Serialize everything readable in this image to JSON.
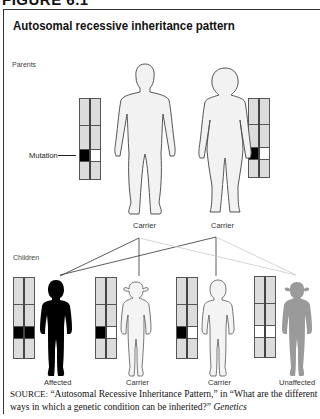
{
  "figure_heading": "FIGURE 6.1",
  "title": "Autosomal recessive inheritance pattern",
  "labels": {
    "parents": "Parents",
    "children": "Children",
    "mutation": "Mutation"
  },
  "parents": [
    {
      "label": "Carrier",
      "sex": "male",
      "chromosomes": [
        "mutated",
        "normal"
      ]
    },
    {
      "label": "Carrier",
      "sex": "female",
      "chromosomes": [
        "mutated",
        "normal"
      ]
    }
  ],
  "children": [
    {
      "label": "Affected",
      "sex": "male",
      "chromosomes": [
        "mutated",
        "mutated"
      ],
      "fill": "#000000"
    },
    {
      "label": "Carrier",
      "sex": "female",
      "chromosomes": [
        "mutated",
        "normal"
      ],
      "fill": "#f2f2f2"
    },
    {
      "label": "Carrier",
      "sex": "male",
      "chromosomes": [
        "mutated",
        "normal"
      ],
      "fill": "#f2f2f2"
    },
    {
      "label": "Unaffected",
      "sex": "female",
      "chromosomes": [
        "normal",
        "normal"
      ],
      "fill": "#999999"
    }
  ],
  "source": {
    "prefix": "SOURCE:",
    "text": " “Autosomal Recessive Inheritance Pattern,” in “What are the different ways in which a genetic condition can be inherited?” ",
    "italic": "Genetics"
  },
  "colors": {
    "mutation": "#000000",
    "normal_allele": "#ffffff",
    "chromosome": "#dcdcdc",
    "unaffected_figure": "#999999"
  }
}
